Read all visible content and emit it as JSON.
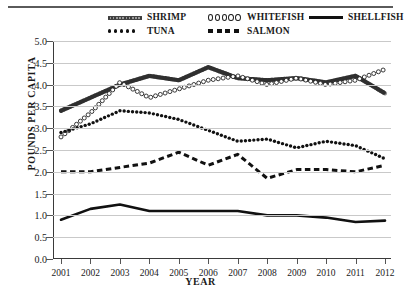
{
  "chart_data": {
    "type": "line",
    "title": "",
    "xlabel": "YEAR",
    "ylabel": "POUNDS PER CAPITA",
    "x": [
      2001,
      2002,
      2003,
      2004,
      2005,
      2006,
      2007,
      2008,
      2009,
      2010,
      2011,
      2012
    ],
    "categories": [
      "2001",
      "2002",
      "2003",
      "2004",
      "2005",
      "2006",
      "2007",
      "2008",
      "2009",
      "2010",
      "2011",
      "2012"
    ],
    "xlim": [
      2000.6,
      2012.6
    ],
    "ylim": [
      0.0,
      5.0
    ],
    "yticks": [
      "0.0",
      "0.5",
      "1.0",
      "1.5",
      "2.0",
      "2.5",
      "3.0",
      "3.5",
      "4.0",
      "4.5",
      "5.0"
    ],
    "ytick_values": [
      0.0,
      0.5,
      1.0,
      1.5,
      2.0,
      2.5,
      3.0,
      3.5,
      4.0,
      4.5,
      5.0
    ],
    "grid": true,
    "legend_position": "top",
    "series": [
      {
        "name": "SHRIMP",
        "style": "thick-hatched-band",
        "color": "#3c3c3c",
        "values": [
          3.4,
          3.7,
          4.0,
          4.2,
          4.1,
          4.4,
          4.15,
          4.1,
          4.15,
          4.05,
          4.2,
          3.8
        ]
      },
      {
        "name": "WHITEFISH",
        "style": "open-circle-dotted",
        "color": "#222222",
        "values": [
          2.8,
          3.35,
          4.05,
          3.7,
          3.9,
          4.1,
          4.2,
          4.0,
          4.15,
          4.0,
          4.1,
          4.35
        ]
      },
      {
        "name": "SHELLFISH",
        "style": "solid-thick",
        "color": "#111111",
        "values": [
          0.9,
          1.15,
          1.25,
          1.1,
          1.1,
          1.1,
          1.1,
          1.0,
          1.0,
          0.95,
          0.85,
          0.88
        ]
      },
      {
        "name": "TUNA",
        "style": "fine-dotted",
        "color": "#111111",
        "values": [
          2.9,
          3.1,
          3.4,
          3.35,
          3.2,
          2.95,
          2.7,
          2.75,
          2.55,
          2.7,
          2.6,
          2.3
        ]
      },
      {
        "name": "SALMON",
        "style": "dashed-thick",
        "color": "#111111",
        "values": [
          2.0,
          2.0,
          2.1,
          2.2,
          2.45,
          2.15,
          2.4,
          1.85,
          2.05,
          2.05,
          2.0,
          2.15
        ]
      }
    ]
  },
  "legend": {
    "items": [
      {
        "label": "SHRIMP",
        "style": "shrimp"
      },
      {
        "label": "WHITEFISH",
        "style": "whitefish"
      },
      {
        "label": "SHELLFISH",
        "style": "solid-thick"
      },
      {
        "label": "TUNA",
        "style": "tuna"
      },
      {
        "label": "SALMON",
        "style": "salmon"
      }
    ]
  }
}
